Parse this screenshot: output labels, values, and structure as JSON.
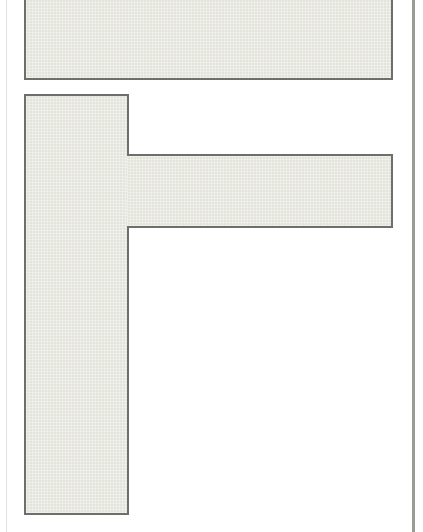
{
  "diagram": {
    "letter": "F",
    "blocks": [
      {
        "id": "top-bar",
        "role": "top horizontal bar"
      },
      {
        "id": "stem",
        "role": "vertical stem"
      },
      {
        "id": "arm",
        "role": "middle horizontal arm"
      }
    ],
    "colors": {
      "fill": "#e4e4dc",
      "border": "#6e6e6a",
      "background": "#ffffff",
      "frame_right": "#9a9a96"
    }
  }
}
